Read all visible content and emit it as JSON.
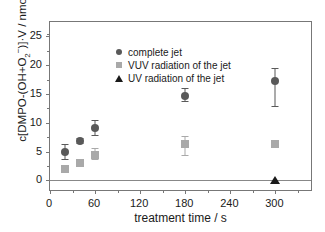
{
  "chart_data": {
    "type": "scatter",
    "title": "",
    "xlabel": "treatment time / s",
    "ylabel": "c[DMPO-(OH+O2-)]·V / nmol",
    "ylabel_parts": {
      "prefix": "c[DMPO-(OH+O",
      "sub": "2",
      "sup": "−",
      "suffix": ")]·V / nmol"
    },
    "xlim": [
      0,
      350
    ],
    "ylim": [
      -2.0,
      27.5
    ],
    "xticks": [
      0,
      60,
      120,
      180,
      240,
      300
    ],
    "yticks": [
      0,
      5,
      10,
      15,
      20,
      25
    ],
    "x_minor_ticks": [
      30,
      90,
      150,
      210,
      270,
      330
    ],
    "y_minor_ticks": [
      2.5,
      7.5,
      12.5,
      17.5,
      22.5,
      25.5
    ],
    "grid": false,
    "legend_position": "top-left",
    "zero_line": true,
    "series": [
      {
        "name": "complete jet",
        "marker": "circle",
        "color": "#595959",
        "points": [
          {
            "x": 20,
            "y": 4.9,
            "err_low": 1.3,
            "err_high": 1.4
          },
          {
            "x": 40,
            "y": 6.9,
            "err_low": 0.5,
            "err_high": 0.5
          },
          {
            "x": 60,
            "y": 9.1,
            "err_low": 1.3,
            "err_high": 1.4
          },
          {
            "x": 180,
            "y": 14.7,
            "err_low": 1.1,
            "err_high": 1.3
          },
          {
            "x": 300,
            "y": 17.3,
            "err_low": 4.5,
            "err_high": 2.2
          }
        ]
      },
      {
        "name": "VUV radiation of the jet",
        "marker": "square",
        "color": "#a9a9a9",
        "points": [
          {
            "x": 20,
            "y": 2.0,
            "err_low": 0.0,
            "err_high": 0.0
          },
          {
            "x": 40,
            "y": 3.0,
            "err_low": 0.0,
            "err_high": 0.0
          },
          {
            "x": 60,
            "y": 4.5,
            "err_low": 1.0,
            "err_high": 1.1
          },
          {
            "x": 180,
            "y": 6.3,
            "err_low": 2.1,
            "err_high": 1.5
          },
          {
            "x": 300,
            "y": 6.4,
            "err_low": 0.8,
            "err_high": 0.7
          }
        ]
      },
      {
        "name": "UV radiation of the jet",
        "marker": "triangle",
        "color": "#1a1a1a",
        "points": [
          {
            "x": 300,
            "y": 0.0,
            "err_low": 0.0,
            "err_high": 0.0
          }
        ]
      }
    ]
  },
  "legend": {
    "items": [
      {
        "label": "complete jet",
        "marker": "circle"
      },
      {
        "label": "VUV radiation of the jet",
        "marker": "square"
      },
      {
        "label": "UV radiation of the jet",
        "marker": "triangle"
      }
    ]
  }
}
